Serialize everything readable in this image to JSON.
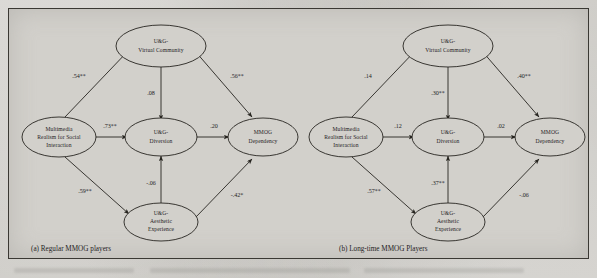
{
  "figure": {
    "type": "path-diagram",
    "panels": [
      {
        "id": "a",
        "caption": "(a) Regular MMOG players",
        "nodes": [
          {
            "id": "mrsi",
            "lines": [
              "Multimedia",
              "Realism for Social",
              "Interaction"
            ]
          },
          {
            "id": "virtual",
            "lines": [
              "U&G-",
              "Virtual Community"
            ]
          },
          {
            "id": "diversion",
            "lines": [
              "U&G-",
              "Diversion"
            ]
          },
          {
            "id": "aesthetic",
            "lines": [
              "U&G-",
              "Aesthetic",
              "Experience"
            ]
          },
          {
            "id": "dependency",
            "lines": [
              "MMOG",
              "Dependency"
            ]
          }
        ],
        "paths": [
          {
            "from": "mrsi",
            "to": "virtual",
            "coefficient": ".54**"
          },
          {
            "from": "mrsi",
            "to": "diversion",
            "coefficient": ".73**"
          },
          {
            "from": "mrsi",
            "to": "aesthetic",
            "coefficient": ".59**"
          },
          {
            "from": "virtual",
            "to": "diversion",
            "coefficient": ".08"
          },
          {
            "from": "virtual",
            "to": "dependency",
            "coefficient": ".56**"
          },
          {
            "from": "diversion",
            "to": "dependency",
            "coefficient": ".20"
          },
          {
            "from": "aesthetic",
            "to": "diversion",
            "coefficient": "-.06"
          },
          {
            "from": "aesthetic",
            "to": "dependency",
            "coefficient": "-.42*"
          }
        ]
      },
      {
        "id": "b",
        "caption": "(b) Long-time MMOG Players",
        "nodes": [
          {
            "id": "mrsi",
            "lines": [
              "Multimedia",
              "Realism for Social",
              "Interaction"
            ]
          },
          {
            "id": "virtual",
            "lines": [
              "U&G-",
              "Virtual Community"
            ]
          },
          {
            "id": "diversion",
            "lines": [
              "U&G-",
              "Diversion"
            ]
          },
          {
            "id": "aesthetic",
            "lines": [
              "U&G-",
              "Aesthetic",
              "Experience"
            ]
          },
          {
            "id": "dependency",
            "lines": [
              "MMOG",
              "Dependency"
            ]
          }
        ],
        "paths": [
          {
            "from": "mrsi",
            "to": "virtual",
            "coefficient": ".14"
          },
          {
            "from": "mrsi",
            "to": "diversion",
            "coefficient": ".12"
          },
          {
            "from": "mrsi",
            "to": "aesthetic",
            "coefficient": ".57**"
          },
          {
            "from": "virtual",
            "to": "diversion",
            "coefficient": ".30**"
          },
          {
            "from": "virtual",
            "to": "dependency",
            "coefficient": ".40**"
          },
          {
            "from": "diversion",
            "to": "dependency",
            "coefficient": ".02"
          },
          {
            "from": "aesthetic",
            "to": "diversion",
            "coefficient": ".37**"
          },
          {
            "from": "aesthetic",
            "to": "dependency",
            "coefficient": "-.06"
          }
        ]
      }
    ],
    "colors": {
      "stroke": "#272520",
      "paper": "#d2d0cb",
      "frame": "#3a3833"
    }
  }
}
